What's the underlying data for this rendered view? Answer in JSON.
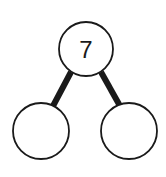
{
  "diagram": {
    "type": "number-bond",
    "whole": {
      "value": "7",
      "cx": 86,
      "cy": 49,
      "r": 27
    },
    "parts": [
      {
        "value": "",
        "cx": 41,
        "cy": 131,
        "r": 28
      },
      {
        "value": "",
        "cx": 129,
        "cy": 131,
        "r": 28
      }
    ],
    "connectors": [
      {
        "x1": 71,
        "y1": 72,
        "x2": 53,
        "y2": 106
      },
      {
        "x1": 101,
        "y1": 72,
        "x2": 120,
        "y2": 106
      }
    ],
    "colors": {
      "stroke": "#1a1a1a",
      "fill": "#ffffff",
      "background": "#ffffff"
    }
  }
}
